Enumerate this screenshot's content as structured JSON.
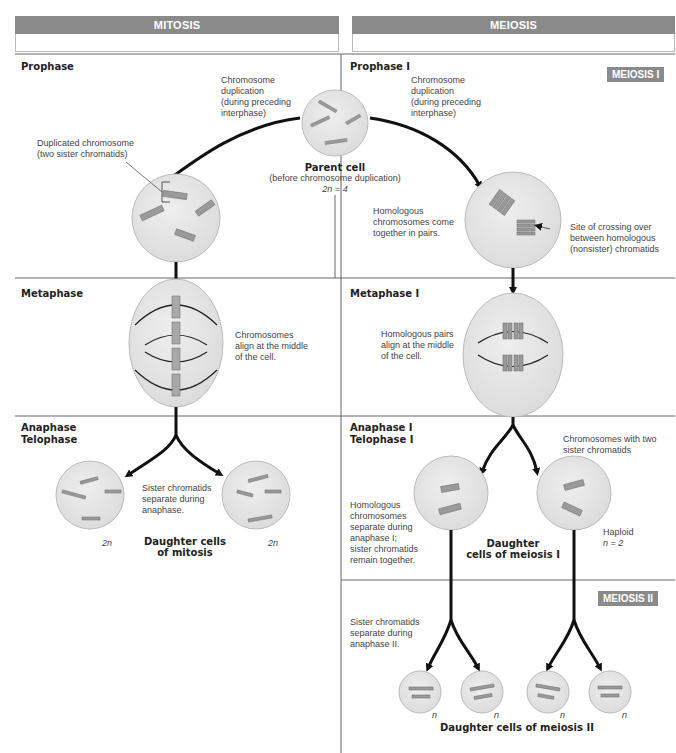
{
  "headers": {
    "mitosis": "MITOSIS",
    "meiosis": "MEIOSIS"
  },
  "tags": {
    "meiosis1": "MEIOSIS I",
    "meiosis2": "MEIOSIS II"
  },
  "phases": {
    "mitosis": {
      "prophase": "Prophase",
      "metaphase": "Metaphase",
      "anaphase": "Anaphase",
      "telophase": "Telophase"
    },
    "meiosis": {
      "prophase": "Prophase I",
      "metaphase": "Metaphase I",
      "anaphase": "Anaphase I",
      "telophase": "Telophase I"
    }
  },
  "labels": {
    "dup_left": [
      "Chromosome",
      "duplication",
      "(during preceding",
      "interphase)"
    ],
    "dup_right": [
      "Chromosome",
      "duplication",
      "(during preceding",
      "interphase)"
    ],
    "duplicated_chromosome": [
      "Duplicated chromosome",
      "(two sister chromatids)"
    ],
    "parent_cell_title": "Parent cell",
    "parent_cell_sub": "(before chromosome duplication)",
    "parent_cell_ploidy": "2n = 4",
    "homologous_pairs_come": [
      "Homologous",
      "chromosomes come",
      "together in pairs."
    ],
    "crossing_over": [
      "Site of crossing over",
      "between homologous",
      "(nonsister) chromatids"
    ],
    "chromosomes_align": [
      "Chromosomes",
      "align at the middle",
      "of the cell."
    ],
    "homologous_align": [
      "Homologous pairs",
      "align at the middle",
      "of the cell."
    ],
    "sister_separate": [
      "Sister chromatids",
      "separate during",
      "anaphase."
    ],
    "mitosis_ploidy_left": "2n",
    "mitosis_ploidy_right": "2n",
    "daughter_mitosis": [
      "Daughter cells",
      "of mitosis"
    ],
    "chromosomes_two_sister": [
      "Chromosomes with two",
      "sister chromatids"
    ],
    "homologous_separate": [
      "Homologous",
      "chromosomes",
      "separate during",
      "anaphase I;",
      "sister chromatids",
      "remain together."
    ],
    "daughter_meiosis1": [
      "Daughter",
      "cells of meiosis I"
    ],
    "haploid": [
      "Haploid",
      "n = 2"
    ],
    "sister_separate_II": [
      "Sister chromatids",
      "separate during",
      "anaphase II."
    ],
    "meiosis2_ploidy": [
      "n",
      "n",
      "n",
      "n"
    ],
    "daughter_meiosis2": "Daughter cells of meiosis II"
  },
  "colors": {
    "header_bg": "#8a8a8a",
    "cell_fill": "#e6e6e6",
    "cell_stroke": "#b8b8b8",
    "chromosome": "#9a9a9a",
    "arrow": "#111111"
  }
}
